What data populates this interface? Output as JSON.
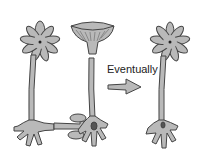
{
  "diagram": {
    "label": "Eventually",
    "colors": {
      "fill": "#b9b9b9",
      "stroke": "#444444",
      "background": "#ffffff",
      "nucleus": "#222222"
    },
    "elements": [
      {
        "name": "left-cell",
        "description": "cell with star cap, stalk, rhizoid"
      },
      {
        "name": "middle-cell",
        "description": "cell with umbrella cap, stalk, rhizoid with nucleus"
      },
      {
        "name": "transfer-arrow",
        "description": "arrow from left rhizoid to middle rhizoid"
      },
      {
        "name": "eventually-arrow",
        "description": "arrow pointing right"
      },
      {
        "name": "right-cell",
        "description": "resulting cell with star cap"
      }
    ]
  }
}
